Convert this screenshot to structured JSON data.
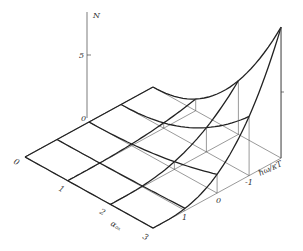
{
  "figure": {
    "vertical_axis": {
      "label": "N",
      "tick_label": "5",
      "origin_label": "0"
    },
    "axis_u": {
      "label": "αₒₓ",
      "tick_labels": [
        "0",
        "1",
        "2",
        "3"
      ]
    },
    "axis_v": {
      "label": "ħω/κT",
      "tick_labels": [
        "1",
        "0",
        "-1"
      ]
    }
  },
  "chart_data": {
    "type": "surface",
    "title": "",
    "zlabel": "N",
    "u_label": "αₒₓ",
    "v_label": "ħω/κT",
    "u_ticks": [
      0,
      1,
      2,
      3
    ],
    "v_ticks": [
      1,
      0,
      -1
    ],
    "z_ticks": [
      0,
      5
    ],
    "surface_heights_by_u_then_v": [
      [
        0,
        0,
        0,
        0,
        0
      ],
      [
        0,
        0,
        0,
        0.2,
        1.3
      ],
      [
        0,
        0,
        0.3,
        1.2,
        4.5
      ],
      [
        0,
        0.2,
        1.5,
        4.5,
        10.4
      ]
    ],
    "note": "Heights read approximately from projection; v index 0..4 corresponds to ħω/κT = 1, 0, -1, -2 (edge)"
  }
}
